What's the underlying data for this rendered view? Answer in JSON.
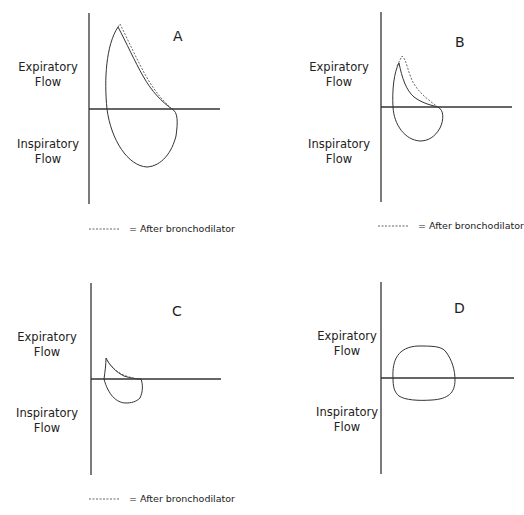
{
  "figure": {
    "axis_labels": {
      "expiratory_line1": "Expiratory",
      "expiratory_line2": "Flow",
      "inspiratory_line1": "Inspiratory",
      "inspiratory_line2": "Flow"
    },
    "legend_text": "= After bronchodilator",
    "panels": [
      {
        "id": "A",
        "label": "A",
        "has_legend": true
      },
      {
        "id": "B",
        "label": "B",
        "has_legend": true
      },
      {
        "id": "C",
        "label": "C",
        "has_legend": true
      },
      {
        "id": "D",
        "label": "D",
        "has_legend": false
      }
    ]
  },
  "colors": {
    "line": "#333333",
    "background": "#ffffff"
  }
}
